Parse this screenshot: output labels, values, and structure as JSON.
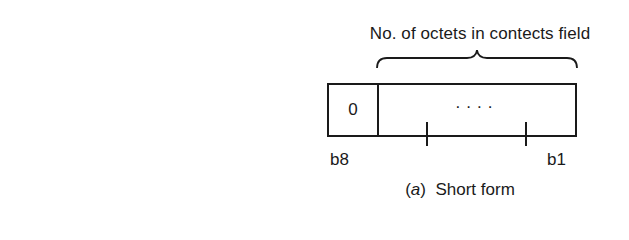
{
  "figure": {
    "top_caption": "No. of octets in contects field",
    "octet": {
      "first_bit_value": "0",
      "remaining_bits": "....",
      "msb_label": "b8",
      "lsb_label": "b1"
    },
    "bottom_caption": {
      "open_paren": "(",
      "sub_label": "a",
      "close_paren": ")",
      "title": "Short form"
    }
  }
}
